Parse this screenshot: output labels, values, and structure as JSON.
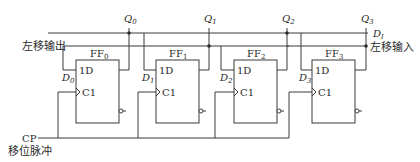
{
  "diagram": {
    "type": "4-bit bidirectional shift register (D flip-flops)",
    "flip_flops": [
      {
        "name": "FF",
        "sub": "0",
        "d_label": "D",
        "d_sub": "0",
        "d_input": "1D",
        "clk_input": "C1",
        "output": "Q",
        "output_sub": "0"
      },
      {
        "name": "FF",
        "sub": "1",
        "d_label": "D",
        "d_sub": "1",
        "d_input": "1D",
        "clk_input": "C1",
        "output": "Q",
        "output_sub": "1"
      },
      {
        "name": "FF",
        "sub": "2",
        "d_label": "D",
        "d_sub": "2",
        "d_input": "1D",
        "clk_input": "C1",
        "output": "Q",
        "output_sub": "2"
      },
      {
        "name": "FF",
        "sub": "3",
        "d_label": "D",
        "d_sub": "3",
        "d_input": "1D",
        "clk_input": "C1",
        "output": "Q",
        "output_sub": "3"
      }
    ],
    "left_shift_output": "左移输出",
    "left_shift_input": "左移输入",
    "serial_input": {
      "main": "D",
      "sub": "I"
    },
    "clock": {
      "label": "CP",
      "caption": "移位脉冲"
    },
    "colors": {
      "line": "#3a3a3a",
      "text": "#2a2a2a",
      "background": "#ffffff"
    }
  }
}
